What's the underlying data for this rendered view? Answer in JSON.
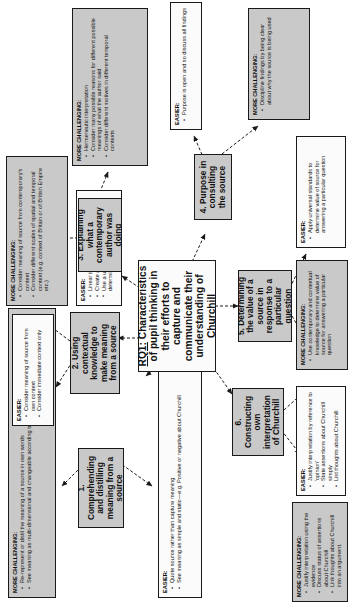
{
  "diagram": {
    "section_label": "RQ2",
    "central": {
      "label": "RQ1:",
      "text": "Characteristics of pupil thinking in their efforts to capture and communicate their understanding of Churchill"
    },
    "nodes": [
      {
        "id": "n1",
        "text": "1. Comprehending and distilling meaning from a source"
      },
      {
        "id": "n2",
        "text": "2. Using contextual knowledge to make meaning from a source"
      },
      {
        "id": "n3",
        "text": "3. Explaining what a contemporary author was doing"
      },
      {
        "id": "n4",
        "text": "4. Purpose in consulting the source"
      },
      {
        "id": "n5",
        "text": "5. Determining the value of a source in response to a particular question"
      },
      {
        "id": "n6",
        "text": "6. Constructing own interpretation of Churchill"
      }
    ],
    "callouts": [
      {
        "id": "c1_hard",
        "heading": "MORE CHALLENGING:",
        "items": [
          "Re-represent or distil the meaning of a source in own words",
          "See meaning as multi-dimensional and changeable according to context"
        ]
      },
      {
        "id": "c1_easy",
        "heading": "EASIER:",
        "items": [
          "Quote source rather than capture meaning",
          "See meaning as simple and static—e.g. Positive or negative about Churchill"
        ]
      },
      {
        "id": "c2_easy",
        "heading": "EASIER:",
        "items": [
          "Consider meaning of source from own context",
          "Consider immediate context only"
        ]
      },
      {
        "id": "c2_hard",
        "heading": "MORE CHALLENGING:",
        "items": [
          "Consider meaning of source from contemporary's context",
          "Consider different scales of spatial and temporal context (e.g. context of Britain or of British Empire etc.)"
        ]
      },
      {
        "id": "c3_easy",
        "heading": "EASIER:",
        "items": [
          "Linear interpretation",
          "Create a final list of reasons",
          "Use a universal, static method of determining motives"
        ]
      },
      {
        "id": "c3_hard",
        "heading": "MORE CHALLENGING:",
        "items": [
          "Hermeneutic interpretation",
          "Consider many possible reasons for different possible meanings of what the author said",
          "Consider different motives in different temporal contexts"
        ]
      },
      {
        "id": "c4_easy",
        "heading": "EASIER:",
        "items": [
          "Purpose is open and so discuss all findings"
        ]
      },
      {
        "id": "c4_hard",
        "heading": "MORE CHALLENGING:",
        "items": [
          "Discipline findings by being clear about why the source is being used"
        ]
      },
      {
        "id": "c5_easy",
        "heading": "EASIER:",
        "items": [
          "Apply universal standards to determine value of source for answering a particular question"
        ]
      },
      {
        "id": "c5_hard",
        "heading": "MORE CHALLENGING:",
        "items": [
          "Use contemporary and contextual knowledge to determine value of source for answering a particular question"
        ]
      },
      {
        "id": "c6_easy",
        "heading": "EASIER:",
        "items": [
          "Justify interpretation by reference to 'opinion'",
          "State assertions about Churchill simply",
          "List thoughts about Churchill"
        ]
      },
      {
        "id": "c6_hard",
        "heading": "MORE CHALLENGING:",
        "items": [
          "Justify interpretation using the evidence",
          "Discuss status of assertions about Churchill",
          "Link thoughts about Churchill into an argument."
        ]
      }
    ],
    "colors": {
      "challenging_fill": "#c9c9c9",
      "easier_fill": "#fbfbfb",
      "node_fill": "#c9c9c9",
      "central_fill": "#ffffff",
      "stroke": "#1a1a1a"
    }
  }
}
